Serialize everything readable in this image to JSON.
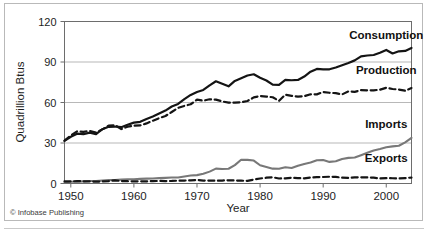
{
  "figure": {
    "credit": "© Infobase Publishing"
  },
  "chart_data": {
    "type": "line",
    "title": "",
    "xlabel": "Year",
    "ylabel": "Quadrillion Btus",
    "xlim": [
      1949,
      2004
    ],
    "ylim": [
      0,
      120
    ],
    "ytick_labels": [
      "0",
      "30",
      "60",
      "90",
      "120"
    ],
    "yticks": [
      0,
      30,
      60,
      90,
      120
    ],
    "xtick_labels": [
      "1950",
      "1960",
      "1970",
      "1980",
      "1990",
      "2000"
    ],
    "xticks": [
      1950,
      1960,
      1970,
      1980,
      1990,
      2000
    ],
    "grid": "horizontal",
    "legend_position": "inline-right-labels",
    "colors": {
      "consumption": "#141414",
      "production": "#141414",
      "imports": "#787878",
      "exports": "#141414",
      "gridline": "#9a9a9a",
      "axis": "#6d6d6d",
      "frame": "#b9b9b9"
    },
    "x": [
      1949,
      1950,
      1951,
      1952,
      1953,
      1954,
      1955,
      1956,
      1957,
      1958,
      1959,
      1960,
      1961,
      1962,
      1963,
      1964,
      1965,
      1966,
      1967,
      1968,
      1969,
      1970,
      1971,
      1972,
      1973,
      1974,
      1975,
      1976,
      1977,
      1978,
      1979,
      1980,
      1981,
      1982,
      1983,
      1984,
      1985,
      1986,
      1987,
      1988,
      1989,
      1990,
      1991,
      1992,
      1993,
      1994,
      1995,
      1996,
      1997,
      1998,
      1999,
      2000,
      2001,
      2002,
      2003,
      2004
    ],
    "series": [
      {
        "name": "Consumption",
        "style": "solid",
        "color": "#141414",
        "label_x": 2000,
        "label_y": 107,
        "values": [
          31.6,
          34.6,
          36.9,
          36.5,
          37.7,
          36.6,
          40.2,
          42.0,
          42.2,
          41.7,
          43.5,
          45.1,
          45.7,
          47.8,
          49.6,
          51.8,
          54.0,
          57.0,
          58.9,
          62.5,
          65.6,
          67.8,
          69.3,
          72.7,
          75.7,
          73.9,
          72.0,
          76.0,
          78.0,
          80.0,
          80.9,
          78.3,
          76.3,
          73.2,
          73.1,
          76.8,
          76.5,
          76.7,
          79.2,
          82.8,
          84.9,
          84.6,
          84.6,
          85.9,
          87.6,
          89.3,
          91.2,
          94.2,
          94.8,
          95.2,
          96.8,
          98.9,
          96.3,
          97.9,
          98.2,
          100.4
        ]
      },
      {
        "name": "Production",
        "style": "dashed",
        "color": "#141414",
        "label_x": 2000,
        "label_y": 81,
        "values": [
          31.7,
          35.5,
          38.6,
          38.3,
          38.9,
          37.8,
          40.1,
          42.8,
          43.2,
          40.3,
          42.1,
          42.8,
          43.0,
          44.5,
          46.5,
          48.4,
          50.0,
          53.0,
          56.0,
          57.5,
          58.7,
          62.1,
          61.3,
          62.4,
          62.1,
          60.8,
          59.9,
          59.9,
          60.2,
          61.1,
          63.8,
          64.8,
          64.4,
          63.9,
          61.2,
          65.8,
          64.9,
          64.3,
          64.7,
          66.1,
          66.0,
          67.8,
          67.2,
          66.9,
          66.0,
          68.2,
          67.9,
          69.1,
          69.0,
          69.0,
          69.5,
          70.9,
          70.0,
          69.6,
          68.7,
          70.7
        ]
      },
      {
        "name": "Imports",
        "style": "solid",
        "color": "#787878",
        "label_x": 2000,
        "label_y": 41,
        "values": [
          0.9,
          1.3,
          1.4,
          1.6,
          1.8,
          1.8,
          2.2,
          2.5,
          2.6,
          2.9,
          3.2,
          3.2,
          3.4,
          3.6,
          3.7,
          4.0,
          4.2,
          4.4,
          4.5,
          5.2,
          5.9,
          6.2,
          7.2,
          8.8,
          11.0,
          10.7,
          10.9,
          13.6,
          17.6,
          17.5,
          17.0,
          13.5,
          12.2,
          11.0,
          10.9,
          12.0,
          11.5,
          13.2,
          14.5,
          15.5,
          17.2,
          17.4,
          16.0,
          16.5,
          18.2,
          19.0,
          19.3,
          21.0,
          22.8,
          24.5,
          25.5,
          26.8,
          27.5,
          28.0,
          30.5,
          33.8
        ]
      },
      {
        "name": "Exports",
        "style": "dashed",
        "color": "#141414",
        "label_x": 2000,
        "label_y": 16,
        "values": [
          1.6,
          1.5,
          1.8,
          1.6,
          1.5,
          1.4,
          1.5,
          1.8,
          2.3,
          1.8,
          1.7,
          1.5,
          1.6,
          1.6,
          1.8,
          1.9,
          1.8,
          1.9,
          2.1,
          2.2,
          2.3,
          2.6,
          2.2,
          2.1,
          2.1,
          2.2,
          2.4,
          2.2,
          2.1,
          1.9,
          2.9,
          3.7,
          4.3,
          4.6,
          3.7,
          3.8,
          4.2,
          4.0,
          3.8,
          4.4,
          4.7,
          4.8,
          5.0,
          4.9,
          4.3,
          4.1,
          4.5,
          4.6,
          4.5,
          4.3,
          3.8,
          4.0,
          3.9,
          3.7,
          4.0,
          4.4
        ]
      }
    ]
  }
}
